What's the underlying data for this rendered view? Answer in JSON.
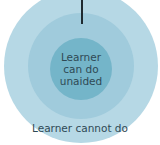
{
  "diagram": {
    "type": "concentric-circles",
    "rings": [
      {
        "id": "outer",
        "label": "Learner cannot do",
        "color": "#b6d8e5"
      },
      {
        "id": "middle",
        "label": "",
        "color": "#a0cbdc"
      },
      {
        "id": "inner",
        "label": "Learner\ncan do\nunaided",
        "color": "#74b5c9"
      }
    ],
    "pointer": {
      "target": "middle",
      "color": "#1f2a30"
    }
  }
}
